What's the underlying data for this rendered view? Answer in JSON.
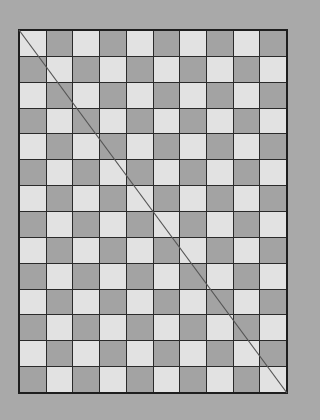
{
  "board": {
    "columns": 10,
    "rows": 14,
    "first_cell": "light",
    "colors": {
      "background": "#a9a9a9",
      "light": "#e2e2e2",
      "dark": "#a3a3a3",
      "grid_line": "#2a2a2a",
      "border": "#1e1e1e",
      "diagonal": "#555555"
    },
    "diagonal": {
      "from": "top-left",
      "to": "bottom-right"
    }
  }
}
